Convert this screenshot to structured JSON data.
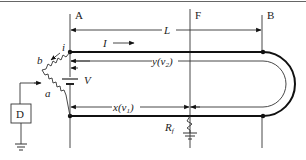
{
  "diagram": {
    "type": "circuit-schematic",
    "points": {
      "A": "A",
      "F": "F",
      "B": "B"
    },
    "labels": {
      "length": "L",
      "current": "I",
      "voltage": "V",
      "detector": "D",
      "resistor_a": "a",
      "resistor_b": "b",
      "tap_i": "i",
      "x_distance": "x(v",
      "x_sub": "1",
      "y_distance": "y(v",
      "y_sub": "2",
      "fault_resistor": "R",
      "fault_sub": "f",
      "close_paren": ")"
    },
    "colors": {
      "line": "#333333",
      "wire": "#111111",
      "background": "#ffffff"
    }
  }
}
